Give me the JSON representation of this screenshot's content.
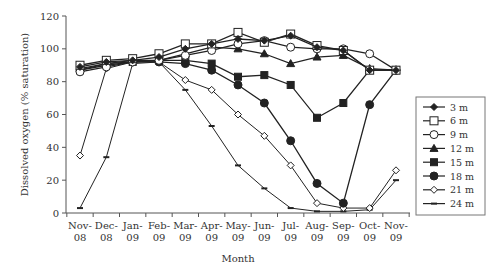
{
  "chart_data": {
    "type": "line",
    "title": "",
    "xlabel": "Month",
    "ylabel": "Dissolved oxygen (% saturation)",
    "ylim": [
      0,
      120
    ],
    "yticks": [
      0,
      20,
      40,
      60,
      80,
      100,
      120
    ],
    "grid": false,
    "legend_position": "right",
    "categories": [
      "Nov-08",
      "Dec-08",
      "Jan-09",
      "Feb-09",
      "Mar-09",
      "Apr-09",
      "May-09",
      "Jun-09",
      "Jul-09",
      "Aug-09",
      "Sep-09",
      "Oct-09",
      "Nov-09"
    ],
    "category_lines": [
      [
        "Nov-",
        "08"
      ],
      [
        "Dec-",
        "08"
      ],
      [
        "Jan-",
        "09"
      ],
      [
        "Feb-",
        "09"
      ],
      [
        "Mar-",
        "09"
      ],
      [
        "Apr-",
        "09"
      ],
      [
        "May-",
        "09"
      ],
      [
        "Jun-",
        "09"
      ],
      [
        "Jul-",
        "09"
      ],
      [
        "Aug-",
        "09"
      ],
      [
        "Sep-",
        "09"
      ],
      [
        "Oct-",
        "09"
      ],
      [
        "Nov-",
        "09"
      ]
    ],
    "series": [
      {
        "name": "3 m",
        "marker": "diamond-filled",
        "values": [
          89,
          92,
          93,
          95,
          100,
          103,
          106,
          105,
          108,
          101,
          99,
          87,
          87
        ]
      },
      {
        "name": "6 m",
        "marker": "square-open",
        "values": [
          90,
          93,
          94,
          97,
          103,
          103,
          110,
          104,
          109,
          102,
          99,
          87,
          87
        ]
      },
      {
        "name": "9 m",
        "marker": "circle-open",
        "values": [
          86,
          89,
          92,
          93,
          96,
          99,
          103,
          105,
          101,
          100,
          100,
          97,
          87
        ]
      },
      {
        "name": "12 m",
        "marker": "triangle-filled",
        "values": [
          88,
          91,
          93,
          93,
          97,
          101,
          100,
          97,
          91,
          95,
          96,
          88,
          87
        ]
      },
      {
        "name": "15 m",
        "marker": "square-filled",
        "values": [
          87,
          91,
          92,
          93,
          93,
          91,
          83,
          84,
          78,
          58,
          67,
          87,
          87
        ]
      },
      {
        "name": "18 m",
        "marker": "circle-filled",
        "values": [
          87,
          90,
          92,
          92,
          91,
          87,
          78,
          67,
          44,
          18,
          6,
          66,
          87
        ]
      },
      {
        "name": "21 m",
        "marker": "diamond-open",
        "values": [
          35,
          88,
          92,
          92,
          81,
          75,
          60,
          47,
          29,
          6,
          3,
          3,
          26
        ]
      },
      {
        "name": "24 m",
        "marker": "dash",
        "values": [
          3,
          34,
          91,
          92,
          75,
          53,
          29,
          15,
          3,
          1,
          1,
          2,
          20
        ]
      }
    ]
  },
  "colors": {
    "line": "#222222",
    "axis": "#555555",
    "text": "#333333",
    "legend_border": "#777777"
  }
}
